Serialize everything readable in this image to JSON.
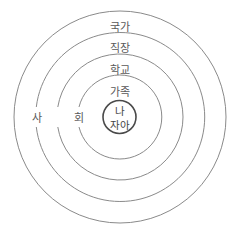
{
  "diagram": {
    "type": "concentric-circles",
    "center": {
      "label_top": "나",
      "label_bottom": "자아"
    },
    "rings": [
      {
        "label": "가족"
      },
      {
        "label": "학교"
      },
      {
        "label": "직장"
      },
      {
        "label": "국가"
      }
    ],
    "side_labels": {
      "left": "사",
      "right": "회"
    }
  }
}
